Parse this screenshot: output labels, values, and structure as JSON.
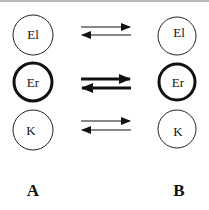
{
  "diagram": {
    "states": {
      "left": {
        "label": "A",
        "nodes": [
          {
            "name": "El",
            "emphasis": "normal"
          },
          {
            "name": "Er",
            "emphasis": "bold"
          },
          {
            "name": "K",
            "emphasis": "normal"
          }
        ]
      },
      "right": {
        "label": "B",
        "nodes": [
          {
            "name": "El",
            "emphasis": "normal"
          },
          {
            "name": "Er",
            "emphasis": "bold"
          },
          {
            "name": "K",
            "emphasis": "normal"
          }
        ]
      }
    },
    "equilibria": [
      {
        "between": "El",
        "type": "reversible",
        "emphasis": "normal"
      },
      {
        "between": "Er",
        "type": "reversible",
        "emphasis": "bold"
      },
      {
        "between": "K",
        "type": "reversible",
        "emphasis": "normal"
      }
    ],
    "colors": {
      "stroke": "#111111",
      "background": "#ffffff",
      "top_border": "#b8b8b8"
    }
  }
}
